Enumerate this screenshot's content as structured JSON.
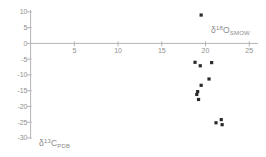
{
  "chart": {
    "xlabel": {
      "prefix": "δ",
      "sup": "18",
      "element": "O",
      "sub": "SMOW"
    },
    "ylabel": {
      "prefix": "δ",
      "sup": "13",
      "element": "C",
      "sub": "PDB"
    }
  },
  "chart_data": {
    "type": "scatter",
    "title": "",
    "xlabel": "δ18O SMOW",
    "ylabel": "δ13C PDB",
    "xlim": [
      0,
      26
    ],
    "ylim": [
      -32,
      10
    ],
    "x_ticks": [
      5,
      10,
      15,
      20,
      25
    ],
    "y_ticks": [
      10,
      5,
      0,
      -5,
      -10,
      -15,
      -20,
      -25,
      -30
    ],
    "grid": false,
    "legend": "none",
    "marker": "filled-square",
    "marker_color": "#2b2b2b",
    "axis_color": "#b3b3b3",
    "tick_label_color": "#8f8f8f",
    "points": [
      {
        "x": 19.5,
        "y": 9.0
      },
      {
        "x": 18.8,
        "y": -6.0
      },
      {
        "x": 19.4,
        "y": -7.1
      },
      {
        "x": 20.7,
        "y": -6.1
      },
      {
        "x": 20.4,
        "y": -11.3
      },
      {
        "x": 19.5,
        "y": -13.3
      },
      {
        "x": 19.1,
        "y": -15.3
      },
      {
        "x": 19.0,
        "y": -16.2
      },
      {
        "x": 19.2,
        "y": -17.8
      },
      {
        "x": 21.2,
        "y": -25.2
      },
      {
        "x": 21.8,
        "y": -24.2
      },
      {
        "x": 21.9,
        "y": -25.8
      }
    ]
  }
}
